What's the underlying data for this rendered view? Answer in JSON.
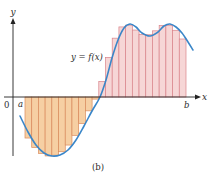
{
  "figure": {
    "caption": "(b)",
    "curve_label": "y = f(x)",
    "axis_labels": {
      "x": "x",
      "y": "y"
    },
    "tick_labels": {
      "origin": "0",
      "a": "a",
      "b": "b"
    },
    "colors": {
      "curve": "#3a86c8",
      "positive_fill": "#f6d6d6",
      "positive_stroke": "#d9838a",
      "negative_fill": "#f6cfa3",
      "negative_stroke": "#d98a5c",
      "axis": "#222222"
    }
  },
  "chart_data": {
    "type": "area",
    "title": "",
    "subtitle": "Riemann sum rectangles approximating the net area under y = f(x) from a to b",
    "xlabel": "x",
    "ylabel": "y",
    "annotations": [
      "y = f(x)",
      "0",
      "a",
      "b",
      "(b)"
    ],
    "interval": [
      "a",
      "b"
    ],
    "num_rectangles": 24,
    "grid": false,
    "legend": null,
    "curve_points_px": [
      [
        20,
        116
      ],
      [
        28,
        132
      ],
      [
        36,
        145
      ],
      [
        44,
        153
      ],
      [
        52,
        156
      ],
      [
        60,
        155
      ],
      [
        68,
        150
      ],
      [
        76,
        140
      ],
      [
        84,
        126
      ],
      [
        92,
        111
      ],
      [
        100,
        97
      ],
      [
        106,
        80
      ],
      [
        112,
        58
      ],
      [
        118,
        40
      ],
      [
        124,
        28
      ],
      [
        130,
        24
      ],
      [
        136,
        27
      ],
      [
        142,
        33
      ],
      [
        150,
        36
      ],
      [
        158,
        32
      ],
      [
        164,
        26
      ],
      [
        170,
        24
      ],
      [
        176,
        27
      ],
      [
        182,
        33
      ],
      [
        188,
        42
      ],
      [
        193,
        50
      ]
    ]
  }
}
